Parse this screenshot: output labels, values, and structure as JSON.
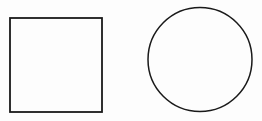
{
  "canvas": {
    "width": 262,
    "height": 121,
    "background": "#fdfdfd"
  },
  "shapes": [
    {
      "type": "square",
      "x": 10,
      "y": 18,
      "width": 92,
      "height": 94,
      "stroke": "#1a1a1a",
      "stroke_width": 1.8,
      "fill": "none"
    },
    {
      "type": "circle",
      "cx": 200,
      "cy": 59.5,
      "r": 52,
      "stroke": "#1a1a1a",
      "stroke_width": 1.5,
      "fill": "none"
    }
  ]
}
